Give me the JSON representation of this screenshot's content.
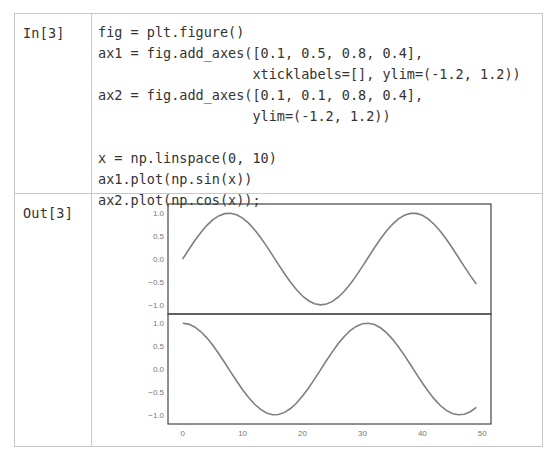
{
  "input_cell": {
    "prompt": "In[3]",
    "code_lines": [
      "fig = plt.figure()",
      "ax1 = fig.add_axes([0.1, 0.5, 0.8, 0.4],",
      "                   xticklabels=[], ylim=(-1.2, 1.2))",
      "ax2 = fig.add_axes([0.1, 0.1, 0.8, 0.4],",
      "                   ylim=(-1.2, 1.2))",
      "",
      "x = np.linspace(0, 10)",
      "ax1.plot(np.sin(x))",
      "ax2.plot(np.cos(x));"
    ]
  },
  "output_cell": {
    "prompt": "Out[3]"
  },
  "colors": {
    "line": "#7f7f7f",
    "frame": "#444444",
    "border": "#c8c8c8",
    "text": "#333333",
    "tick_text": "#777777"
  },
  "chart_data": [
    {
      "type": "line",
      "title": "",
      "xlabel": "",
      "ylabel": "",
      "series": [
        {
          "name": "np.sin(x)",
          "function": "sin",
          "x_domain": [
            0,
            10
          ],
          "n_points": 50
        }
      ],
      "x": "index 0..49",
      "ylim": [
        -1.2,
        1.2
      ],
      "xlim": [
        -2.45,
        51.45
      ],
      "yticks": [
        "1.0",
        "0.5",
        "0.0",
        "-0.5",
        "-1.0"
      ],
      "xticks": [],
      "grid": false,
      "legend": null,
      "position": "top"
    },
    {
      "type": "line",
      "title": "",
      "xlabel": "",
      "ylabel": "",
      "series": [
        {
          "name": "np.cos(x)",
          "function": "cos",
          "x_domain": [
            0,
            10
          ],
          "n_points": 50
        }
      ],
      "x": "index 0..49",
      "ylim": [
        -1.2,
        1.2
      ],
      "xlim": [
        -2.45,
        51.45
      ],
      "yticks": [
        "1.0",
        "0.5",
        "0.0",
        "-0.5",
        "-1.0"
      ],
      "xticks": [
        "0",
        "10",
        "20",
        "30",
        "40",
        "50"
      ],
      "grid": false,
      "legend": null,
      "position": "bottom"
    }
  ]
}
